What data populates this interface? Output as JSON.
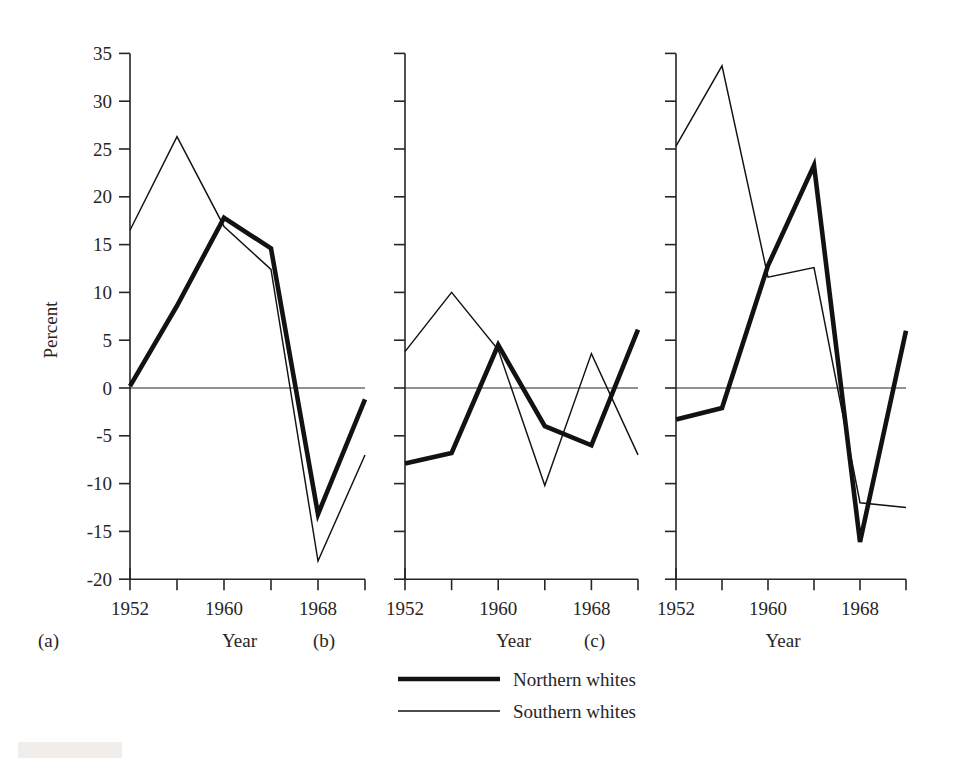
{
  "figure": {
    "ylabel": "Percent",
    "xlabel": "Year",
    "y_ticks": [
      "35",
      "30",
      "25",
      "20",
      "15",
      "10",
      "5",
      "0",
      "-5",
      "-10",
      "-15",
      "-20"
    ],
    "y_tick_values": [
      35,
      30,
      25,
      20,
      15,
      10,
      5,
      0,
      -5,
      -10,
      -15,
      -20
    ],
    "x_tick_labels": [
      "1952",
      "",
      "1960",
      "",
      "1968",
      ""
    ],
    "x_tick_values": [
      1952,
      1956,
      1960,
      1964,
      1968,
      1972
    ],
    "panel_labels": [
      "(a)",
      "(b)",
      "(c)"
    ],
    "legend": [
      {
        "label": "Northern whites",
        "style": "thick",
        "color": "#141210"
      },
      {
        "label": "Southern whites",
        "style": "thin",
        "color": "#141210"
      }
    ]
  },
  "chart_data": [
    {
      "type": "line",
      "panel": "(a)",
      "title": "",
      "xlabel": "Year",
      "ylabel": "Percent",
      "x": [
        1952,
        1956,
        1960,
        1964,
        1968,
        1972
      ],
      "xlim": [
        1952,
        1972
      ],
      "ylim": [
        -20,
        35
      ],
      "grid": false,
      "legend_position": "below-figure",
      "series": [
        {
          "name": "Northern whites",
          "style": "thick",
          "values": [
            0.2,
            8.6,
            17.8,
            14.6,
            -13.2,
            -1.2
          ]
        },
        {
          "name": "Southern whites",
          "style": "thin",
          "values": [
            16.5,
            26.3,
            16.9,
            12.4,
            -18.1,
            -7.0
          ]
        }
      ]
    },
    {
      "type": "line",
      "panel": "(b)",
      "title": "",
      "xlabel": "Year",
      "ylabel": "Percent",
      "x": [
        1952,
        1956,
        1960,
        1964,
        1968,
        1972
      ],
      "xlim": [
        1952,
        1972
      ],
      "ylim": [
        -20,
        35
      ],
      "grid": false,
      "legend_position": "below-figure",
      "series": [
        {
          "name": "Northern whites",
          "style": "thick",
          "values": [
            -7.9,
            -6.8,
            4.5,
            -4.0,
            -6.0,
            6.1
          ]
        },
        {
          "name": "Southern whites",
          "style": "thin",
          "values": [
            3.8,
            10.0,
            4.0,
            -10.2,
            3.6,
            -7.0
          ]
        }
      ]
    },
    {
      "type": "line",
      "panel": "(c)",
      "title": "",
      "xlabel": "Year",
      "ylabel": "Percent",
      "x": [
        1952,
        1956,
        1960,
        1964,
        1968,
        1972
      ],
      "xlim": [
        1952,
        1972
      ],
      "ylim": [
        -20,
        35
      ],
      "grid": false,
      "legend_position": "below-figure",
      "series": [
        {
          "name": "Northern whites",
          "style": "thick",
          "values": [
            -3.3,
            -2.1,
            12.8,
            23.3,
            -16.1,
            6.0
          ]
        },
        {
          "name": "Southern whites",
          "style": "thin",
          "values": [
            25.3,
            33.7,
            11.6,
            12.6,
            -12.0,
            -12.5
          ]
        }
      ]
    }
  ]
}
